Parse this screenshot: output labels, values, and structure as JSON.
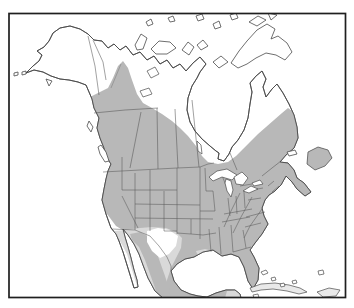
{
  "figure": {
    "kind": "species-distribution-range-map",
    "region": "North America"
  },
  "colors": {
    "background": "#ffffff",
    "land": "#ffffff",
    "range_primary": "#b8b8b8",
    "range_secondary": "#d9d9d9",
    "island_pale": "#e9e9e9",
    "coastline": "#4a4a4a",
    "state_border": "#5a5a5a",
    "frame": "#1f1f1f"
  },
  "features": [
    "Alaska",
    "Aleutian Islands",
    "Canada",
    "Arctic Archipelago",
    "Hudson Bay",
    "James Bay",
    "Labrador",
    "Newfoundland",
    "Great Lakes",
    "United States",
    "Texas unshaded gap",
    "Mexico",
    "Baja California",
    "Yucatan",
    "Florida",
    "Cuba",
    "Hispaniola",
    "Bahamas"
  ]
}
